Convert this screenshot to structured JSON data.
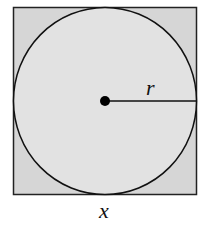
{
  "diagram": {
    "shapes": {
      "square": {
        "fill": "#d6d6d6",
        "stroke": "#222222"
      },
      "circle": {
        "fill": "#e2e2e2",
        "stroke": "#111111"
      },
      "center_dot": {
        "fill": "#000000"
      },
      "radius_line": {
        "stroke": "#111111"
      }
    },
    "labels": {
      "radius": "r",
      "side": "x"
    }
  }
}
